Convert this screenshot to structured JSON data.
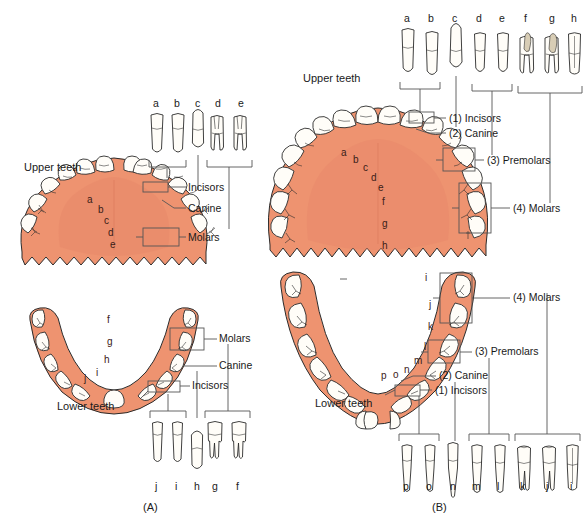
{
  "figure": {
    "background_color": "#ffffff",
    "gum_color": "#ee9370",
    "gum_shade_color": "#e8886a",
    "tooth_fill": "#fffdf8",
    "outline_color": "#2b2b2b",
    "leader_color": "#555555",
    "letter_color": "#3a2018"
  },
  "panels": [
    {
      "id": "A",
      "caption": "(A)",
      "dentition": "deciduous",
      "upper": {
        "title": "Upper teeth",
        "arch_letters": [
          "a",
          "b",
          "c",
          "d",
          "e"
        ],
        "callouts": [
          {
            "label": "Incisors",
            "bracket": true
          },
          {
            "label": "Canine",
            "bracket": false
          },
          {
            "label": "Molars",
            "bracket": true
          }
        ],
        "isolated_teeth": {
          "letters": [
            "a",
            "b",
            "c",
            "d",
            "e"
          ],
          "groups": [
            {
              "name": "Incisors",
              "letters": [
                "a",
                "b"
              ]
            },
            {
              "name": "Canine",
              "letters": [
                "c"
              ]
            },
            {
              "name": "Molars",
              "letters": [
                "d",
                "e"
              ]
            }
          ]
        }
      },
      "lower": {
        "title": "Lower teeth",
        "arch_letters": [
          "f",
          "g",
          "h",
          "i",
          "j"
        ],
        "callouts": [
          {
            "label": "Molars",
            "bracket": true
          },
          {
            "label": "Canine",
            "bracket": false
          },
          {
            "label": "Incisors",
            "bracket": true
          }
        ],
        "isolated_teeth": {
          "letters": [
            "j",
            "i",
            "h",
            "g",
            "f"
          ],
          "groups": [
            {
              "name": "Incisors",
              "letters": [
                "j",
                "i"
              ]
            },
            {
              "name": "Canine",
              "letters": [
                "h"
              ]
            },
            {
              "name": "Molars",
              "letters": [
                "g",
                "f"
              ]
            }
          ]
        }
      }
    },
    {
      "id": "B",
      "caption": "(B)",
      "dentition": "permanent",
      "upper": {
        "title": "Upper teeth",
        "arch_letters": [
          "a",
          "b",
          "c",
          "d",
          "e",
          "f",
          "g",
          "h"
        ],
        "callouts": [
          {
            "label": "(1) Incisors",
            "bracket": true
          },
          {
            "label": "(2) Canine",
            "bracket": false
          },
          {
            "label": "(3) Premolars",
            "bracket": true
          },
          {
            "label": "(4) Molars",
            "bracket": true
          }
        ],
        "isolated_teeth": {
          "letters": [
            "a",
            "b",
            "c",
            "d",
            "e",
            "f",
            "g",
            "h"
          ],
          "groups": [
            {
              "name": "Incisors",
              "letters": [
                "a",
                "b"
              ]
            },
            {
              "name": "Canine",
              "letters": [
                "c"
              ]
            },
            {
              "name": "Premolars",
              "letters": [
                "d",
                "e"
              ]
            },
            {
              "name": "Molars",
              "letters": [
                "f",
                "g",
                "h"
              ]
            }
          ]
        }
      },
      "lower": {
        "title": "Lower teeth",
        "arch_letters": [
          "i",
          "j",
          "k",
          "l",
          "m",
          "n",
          "o",
          "p"
        ],
        "callouts": [
          {
            "label": "(4) Molars",
            "bracket": true
          },
          {
            "label": "(3) Premolars",
            "bracket": true
          },
          {
            "label": "(2) Canine",
            "bracket": false
          },
          {
            "label": "(1) Incisors",
            "bracket": true
          }
        ],
        "isolated_teeth": {
          "letters": [
            "p",
            "o",
            "n",
            "m",
            "l",
            "k",
            "j",
            "i"
          ],
          "groups": [
            {
              "name": "Incisors",
              "letters": [
                "p",
                "o"
              ]
            },
            {
              "name": "Canine",
              "letters": [
                "n"
              ]
            },
            {
              "name": "Premolars",
              "letters": [
                "m",
                "l"
              ]
            },
            {
              "name": "Molars",
              "letters": [
                "k",
                "j",
                "i"
              ]
            }
          ]
        }
      }
    }
  ],
  "text": {
    "a_upper_title": "Upper teeth",
    "a_lower_title": "Lower teeth",
    "b_upper_title": "Upper teeth",
    "b_lower_title": "Lower teeth",
    "a_caption": "(A)",
    "b_caption": "(B)",
    "incisors": "Incisors",
    "canine": "Canine",
    "molars": "Molars",
    "b_incisors": "(1) Incisors",
    "b_canine": "(2) Canine",
    "b_premolars": "(3) Premolars",
    "b_molars": "(4) Molars"
  }
}
